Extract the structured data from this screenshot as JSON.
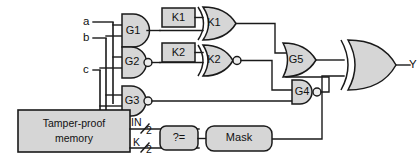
{
  "diagram": {
    "background_color": "#ffffff",
    "line_color": "#1a1a1a",
    "fill_color": "#d6d6d6"
  },
  "inputs": [
    {
      "name": "input-a",
      "label": "a"
    },
    {
      "name": "input-b",
      "label": "b"
    },
    {
      "name": "input-c",
      "label": "c"
    }
  ],
  "outputs": [
    {
      "name": "output-y",
      "label": "Y"
    }
  ],
  "gates": [
    {
      "id": "G1",
      "label": "G1",
      "type": "and"
    },
    {
      "id": "G2",
      "label": "G2",
      "type": "nand"
    },
    {
      "id": "G3",
      "label": "G3",
      "type": "nand"
    },
    {
      "id": "G4",
      "label": "G4",
      "type": "nand"
    },
    {
      "id": "G5",
      "label": "G5",
      "type": "or"
    },
    {
      "id": "K1g",
      "label": "K1",
      "type": "xor"
    },
    {
      "id": "K2g",
      "label": "K2",
      "type": "xnor"
    },
    {
      "id": "OUT",
      "label": "",
      "type": "xor"
    }
  ],
  "key_boxes": [
    {
      "id": "K1box",
      "label": "K1"
    },
    {
      "id": "K2box",
      "label": "K2"
    }
  ],
  "memory": {
    "label_line1": "Tamper-proof",
    "label_line2": "memory",
    "ports": [
      {
        "name": "in-port",
        "label": "IN",
        "width": "2"
      },
      {
        "name": "k-port",
        "label": "K",
        "width": "2"
      }
    ]
  },
  "comparator": {
    "label": "?="
  },
  "mask": {
    "label": "Mask"
  }
}
